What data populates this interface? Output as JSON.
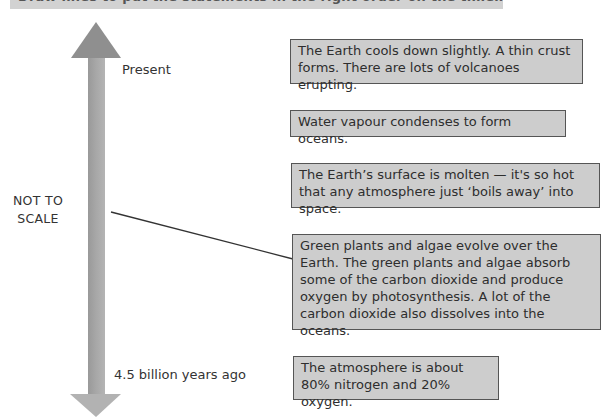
{
  "instruction": {
    "text": "Draw lines to put the statements in the right order on the timeline. One has been done for you."
  },
  "timeline": {
    "top_label": "Present",
    "bottom_label": "4.5 billion years ago",
    "scale_note_line1": "NOT TO",
    "scale_note_line2": "SCALE",
    "arrow_color": "#a9a9a9"
  },
  "statements": [
    {
      "id": "cooling",
      "text": "The Earth cools down slightly.  A thin crust forms.  There are lots of volcanoes erupting."
    },
    {
      "id": "oceans",
      "text": "Water vapour condenses to form oceans."
    },
    {
      "id": "molten",
      "text": "The Earth’s surface is molten — it's so hot that any atmosphere just ‘boils away’ into space."
    },
    {
      "id": "plants",
      "text": "Green plants and algae evolve over the Earth. The green plants and algae absorb some of the carbon dioxide and produce oxygen by photosynthesis.  A lot of the carbon dioxide also dissolves into the oceans."
    },
    {
      "id": "atmosphere",
      "text": "The atmosphere is about 80% nitrogen and 20% oxygen."
    }
  ],
  "connector": {
    "from": "timeline",
    "to": "plants"
  },
  "colors": {
    "box_fill": "#cdcdcd",
    "box_border": "#555555",
    "banner": "#d2d2d2"
  }
}
